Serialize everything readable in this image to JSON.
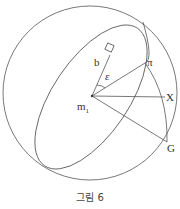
{
  "diagram": {
    "type": "celestial-sphere-geometry",
    "labels": {
      "b": "b",
      "epsilon": "ε",
      "pi": "π",
      "m1_base": "m",
      "m1_sub": "1",
      "X": "X",
      "G": "G"
    },
    "caption": "그림 6",
    "colors": {
      "stroke": "#555555",
      "text": "#333333",
      "background": "#ffffff"
    }
  }
}
